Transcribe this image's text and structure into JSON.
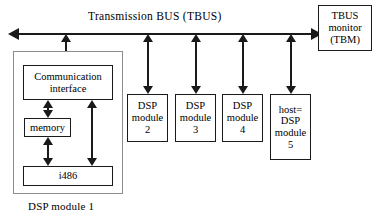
{
  "diagram": {
    "bus": {
      "title": "Transmission  BUS  (TBUS)",
      "left_arrow_icon": "arrow-left-icon",
      "right_arrow_icon": "arrow-right-icon"
    },
    "monitor": {
      "lines": [
        "TBUS",
        "monitor",
        "(TBM)"
      ]
    },
    "module1": {
      "caption": "DSP module  1",
      "comm_interface": {
        "lines": [
          "Communication",
          "interface"
        ]
      },
      "memory": {
        "label": "memory"
      },
      "cpu": {
        "label": "i486"
      }
    },
    "modules": [
      {
        "lines": [
          "DSP",
          "module",
          "2"
        ]
      },
      {
        "lines": [
          "DSP",
          "module",
          "3"
        ]
      },
      {
        "lines": [
          "DSP",
          "module",
          "4"
        ]
      },
      {
        "lines": [
          "host=",
          "DSP",
          "module",
          "5"
        ]
      }
    ],
    "colors": {
      "stroke": "#1a1a1a",
      "outer_stroke": "#8c8c8c",
      "background": "#ffffff"
    }
  }
}
